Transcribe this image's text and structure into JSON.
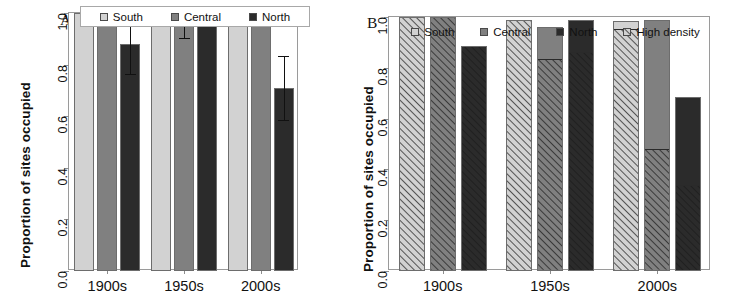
{
  "figure": {
    "width": 732,
    "height": 303,
    "background": "#ffffff"
  },
  "colors": {
    "south": "#d2d2d2",
    "central": "#808080",
    "north": "#2b2b2b",
    "hatch": "#1a1a1a",
    "axis": "#8d8d8d",
    "box": "#9a9a9a",
    "text": "#111111"
  },
  "panels": [
    {
      "id": "A",
      "label": "A",
      "ylabel": "Proportion of sites occupied",
      "legend_boxed": true,
      "legend": [
        {
          "label": "South",
          "swatch": "south"
        },
        {
          "label": "Central",
          "swatch": "central"
        },
        {
          "label": "North",
          "swatch": "north"
        }
      ],
      "chart_data": {
        "type": "bar",
        "title": "A",
        "xlabel": "",
        "ylabel": "Proportion of sites occupied",
        "ylim": [
          0,
          1.0
        ],
        "yticks": [
          "0.0",
          "0.2",
          "0.4",
          "0.6",
          "0.8",
          "1.0"
        ],
        "ytickvals": [
          0.0,
          0.2,
          0.4,
          0.6,
          0.8,
          1.0
        ],
        "grid": false,
        "legend_position": "top-inside",
        "categories": [
          "1900s",
          "1950s",
          "2000s"
        ],
        "series": [
          {
            "name": "South",
            "values": [
              1.0,
              1.0,
              1.0
            ],
            "errors_low": [
              null,
              null,
              null
            ],
            "errors_high": [
              null,
              null,
              null
            ]
          },
          {
            "name": "Central",
            "values": [
              1.0,
              0.96,
              1.0
            ],
            "errors_low": [
              null,
              0.905,
              null
            ],
            "errors_high": [
              null,
              1.0,
              null
            ]
          },
          {
            "name": "North",
            "values": [
              0.88,
              0.99,
              0.71
            ],
            "errors_low": [
              0.765,
              null,
              0.585
            ],
            "errors_high": [
              1.0,
              null,
              0.835
            ]
          }
        ]
      }
    },
    {
      "id": "B",
      "label": "B",
      "ylabel": "Proportion of sites occupied",
      "legend_boxed": false,
      "legend": [
        {
          "label": "South",
          "swatch": "south"
        },
        {
          "label": "Central",
          "swatch": "central"
        },
        {
          "label": "North",
          "swatch": "north"
        },
        {
          "label": "High density",
          "swatch": "hatched"
        }
      ],
      "chart_data": {
        "type": "bar",
        "title": "B",
        "xlabel": "",
        "ylabel": "Proportion of sites occupied",
        "ylim": [
          0,
          1.0
        ],
        "yticks": [
          "0.0",
          "0.2",
          "0.4",
          "0.6",
          "0.8",
          "1.0"
        ],
        "ytickvals": [
          0.0,
          0.2,
          0.4,
          0.6,
          0.8,
          1.0
        ],
        "grid": false,
        "stacked": true,
        "legend_position": "top-outside",
        "categories": [
          "1900s",
          "1950s",
          "2000s"
        ],
        "series": [
          {
            "name": "South",
            "values": [
              1.0,
              0.99,
              0.985
            ],
            "high_density": [
              1.0,
              0.99,
              0.95
            ]
          },
          {
            "name": "Central",
            "values": [
              1.0,
              0.96,
              0.99
            ],
            "high_density": [
              1.0,
              0.83,
              0.475
            ]
          },
          {
            "name": "North",
            "values": [
              0.885,
              0.99,
              0.685
            ],
            "high_density": [
              0.885,
              0.86,
              0.335
            ]
          }
        ]
      }
    }
  ]
}
